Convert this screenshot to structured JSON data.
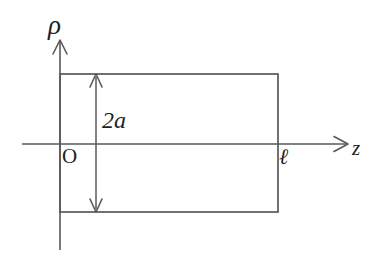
{
  "figure": {
    "domain": "diagram",
    "background_color": "#ffffff",
    "line_color": "#595959",
    "text_color": "#1f1f1f"
  },
  "axes": {
    "vertical": {
      "label": "ρ",
      "name": "rho-axis",
      "direction": "up",
      "x": 60,
      "top_y": 40,
      "bottom_y": 250,
      "has_arrowhead": true
    },
    "horizontal": {
      "label": "z",
      "name": "z-axis",
      "direction": "right",
      "y": 144,
      "left_x": 22,
      "right_x": 348,
      "has_arrowhead": true
    },
    "origin": {
      "label": "O",
      "x": 60,
      "y": 144
    }
  },
  "shapes": {
    "rectangle": {
      "name": "cylinder-cross-section",
      "left": 60,
      "top": 74,
      "right": 278,
      "bottom": 212,
      "width": 218,
      "height": 138,
      "fill": "none",
      "stroke": "#595959"
    }
  },
  "annotations": {
    "height_dimension": {
      "label": "2a",
      "name": "height-dimension",
      "x": 96,
      "from_y": 74,
      "to_y": 212,
      "arrowheads": "both"
    },
    "length_marker": {
      "label": "ℓ",
      "name": "length-marker",
      "x": 278,
      "y": 144
    }
  },
  "labels": {
    "rho": "ρ",
    "z": "z",
    "origin": "O",
    "two_a": "2a",
    "ell": "ℓ"
  }
}
